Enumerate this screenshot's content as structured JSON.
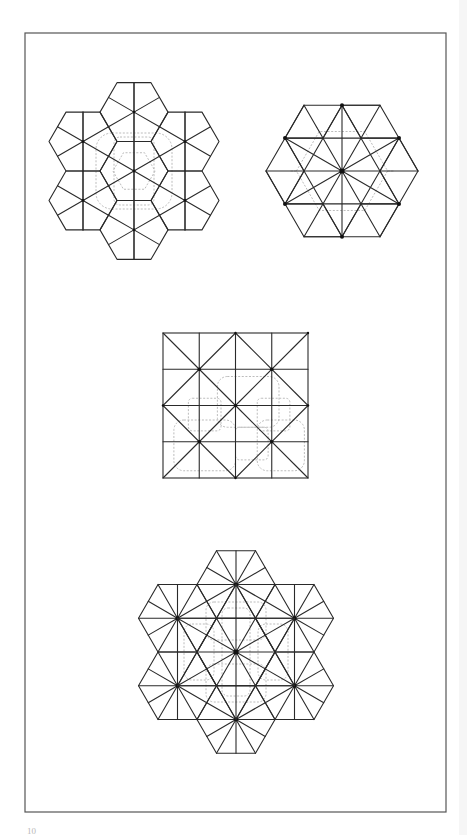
{
  "page": {
    "width": 467,
    "height": 835,
    "background": "#ffffff",
    "frame": {
      "x": 25,
      "y": 33,
      "width": 421,
      "height": 779,
      "stroke": "#555555"
    },
    "page_number": "10"
  },
  "style": {
    "line_color": "#2a2a2a",
    "line_width": 1.1,
    "dash_color": "#b4b4b4",
    "dot_color": "#111111"
  },
  "figures": [
    {
      "id": "pinwheel-hex-cluster",
      "type": "hex-flower-kite",
      "center": [
        134,
        171
      ],
      "hex_side": 34,
      "description": "Seven flat-top hexagons, each divided into kites from a center point; dashed rounded outline overlay"
    },
    {
      "id": "star-hexagon",
      "type": "star-hexagon",
      "center": [
        342,
        171
      ],
      "radius": 76,
      "description": "Single flat-top hexagon with twelve-pointed star pattern of triangles; dashed motif overlay"
    },
    {
      "id": "square-grid",
      "type": "square-x-grid",
      "x": 163,
      "y": 333,
      "size": 145,
      "divisions": 4,
      "description": "Square divided into 4x4 grid with X diagonals in each 2x2 block; dashed rounded shapes overlay"
    },
    {
      "id": "triangulated-hex-cluster",
      "type": "hex-flower-triangulated",
      "center": [
        236,
        652
      ],
      "hex_side": 39,
      "description": "Seven flat-top hexagons each split into 12 triangles from a center point; dashed motif overlay"
    }
  ]
}
